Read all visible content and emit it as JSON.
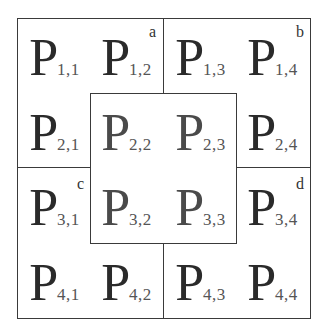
{
  "diagram": {
    "cells": [
      {
        "label": "P",
        "sub": "1,1",
        "row": 1,
        "col": 1
      },
      {
        "label": "P",
        "sub": "1,2",
        "row": 1,
        "col": 2
      },
      {
        "label": "P",
        "sub": "1,3",
        "row": 1,
        "col": 3
      },
      {
        "label": "P",
        "sub": "1,4",
        "row": 1,
        "col": 4
      },
      {
        "label": "P",
        "sub": "2,1",
        "row": 2,
        "col": 1
      },
      {
        "label": "P",
        "sub": "2,2",
        "row": 2,
        "col": 2
      },
      {
        "label": "P",
        "sub": "2,3",
        "row": 2,
        "col": 3
      },
      {
        "label": "P",
        "sub": "2,4",
        "row": 2,
        "col": 4
      },
      {
        "label": "P",
        "sub": "3,1",
        "row": 3,
        "col": 1
      },
      {
        "label": "P",
        "sub": "3,2",
        "row": 3,
        "col": 2
      },
      {
        "label": "P",
        "sub": "3,3",
        "row": 3,
        "col": 3
      },
      {
        "label": "P",
        "sub": "3,4",
        "row": 3,
        "col": 4
      },
      {
        "label": "P",
        "sub": "4,1",
        "row": 4,
        "col": 1
      },
      {
        "label": "P",
        "sub": "4,2",
        "row": 4,
        "col": 2
      },
      {
        "label": "P",
        "sub": "4,3",
        "row": 4,
        "col": 3
      },
      {
        "label": "P",
        "sub": "4,4",
        "row": 4,
        "col": 4
      }
    ],
    "quadrant_labels": {
      "a": "a",
      "b": "b",
      "c": "c",
      "d": "d"
    },
    "colors": {
      "line": "#3a3a3a",
      "text": "#2a2a2a",
      "background": "#ffffff"
    }
  }
}
